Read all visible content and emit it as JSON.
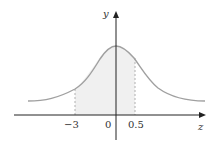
{
  "diagram": {
    "type": "normal-distribution-curve",
    "axes": {
      "x_label": "z",
      "y_label": "y"
    },
    "ticks": [
      {
        "label": "−3",
        "value": -3
      },
      {
        "label": "0",
        "value": 0
      },
      {
        "label": "0.5",
        "value": 0.5
      }
    ],
    "shaded_region": {
      "from": -3,
      "to": 0.5
    },
    "colors": {
      "curve": "#a0a0a0",
      "axis": "#222222",
      "shade": "#f0f0f0",
      "dashed": "#b0b0b0"
    }
  }
}
